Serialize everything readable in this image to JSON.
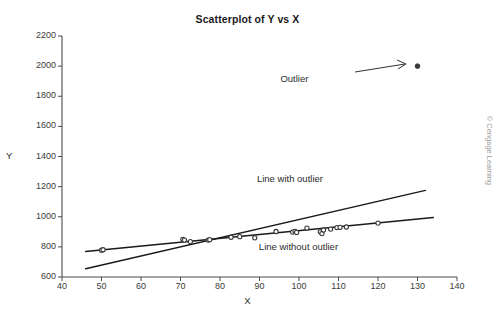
{
  "chart_data": {
    "type": "scatter",
    "title": "Scatterplot of Y vs X",
    "xlabel": "X",
    "ylabel": "Y",
    "xlim": [
      40,
      140
    ],
    "ylim": [
      600,
      2200
    ],
    "xticks": [
      40,
      50,
      60,
      70,
      80,
      90,
      100,
      110,
      120,
      130,
      140
    ],
    "yticks": [
      600,
      800,
      1000,
      1200,
      1400,
      1600,
      1800,
      2000,
      2200
    ],
    "grid": false,
    "legend": "none",
    "marker_color": "#3a3a3a",
    "line_color": "#1a1a1a",
    "points": [
      [
        50.0,
        778
      ],
      [
        50.4,
        781
      ],
      [
        70.6,
        850
      ],
      [
        71.0,
        845
      ],
      [
        72.5,
        835
      ],
      [
        77.0,
        845
      ],
      [
        77.4,
        848
      ],
      [
        82.8,
        864
      ],
      [
        85.0,
        868
      ],
      [
        88.8,
        860
      ],
      [
        94.2,
        902
      ],
      [
        98.4,
        898
      ],
      [
        99.0,
        903
      ],
      [
        99.4,
        896
      ],
      [
        102.0,
        925
      ],
      [
        105.4,
        900
      ],
      [
        105.8,
        888
      ],
      [
        106.2,
        912
      ],
      [
        108.0,
        918
      ],
      [
        109.6,
        928
      ],
      [
        110.4,
        930
      ],
      [
        112.0,
        932
      ],
      [
        120.0,
        958
      ]
    ],
    "outlier": {
      "x": 130,
      "y": 2000,
      "label": "Outlier"
    },
    "lines": [
      {
        "name": "Line with outlier",
        "label": "Line with outlier",
        "x0": 46,
        "y0": 655,
        "x1": 132,
        "y1": 1175
      },
      {
        "name": "Line without outlier",
        "label": "Line without outlier",
        "x0": 46,
        "y0": 770,
        "x1": 134,
        "y1": 995
      }
    ],
    "annotations": [
      {
        "text": "Outlier",
        "x": 112,
        "y": 1908
      },
      {
        "text": "Line with outlier",
        "x": 101,
        "y": 1245
      },
      {
        "text": "Line without outlier",
        "x": 103,
        "y": 790
      }
    ],
    "credit": "© Cengage Learning"
  }
}
